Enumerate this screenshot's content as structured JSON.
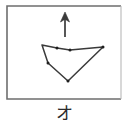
{
  "figure": {
    "caption": "オ",
    "colors": {
      "stroke": "#3a3a3a",
      "frame": "#6e6e6e",
      "frame_light": "#b8b8b8",
      "background": "#ffffff",
      "vertex_dot": "#1f1f1f"
    },
    "frame": {
      "name": "panel-border",
      "x": 7,
      "y": 6,
      "width": 114,
      "height": 93
    },
    "arrow": {
      "name": "up-arrow",
      "direction": "up",
      "x": 65,
      "tail_y": 37,
      "head_y": 12,
      "head_width": 9,
      "head_length": 10
    },
    "polygon": {
      "name": "sketch-polygon",
      "closed": true,
      "points": [
        {
          "x": 42,
          "y": 45
        },
        {
          "x": 57,
          "y": 48
        },
        {
          "x": 70,
          "y": 50
        },
        {
          "x": 103,
          "y": 47
        },
        {
          "x": 68,
          "y": 81
        },
        {
          "x": 48,
          "y": 63
        }
      ],
      "vertex_markers": [
        {
          "x": 57,
          "y": 48
        },
        {
          "x": 70,
          "y": 50
        },
        {
          "x": 103,
          "y": 47
        },
        {
          "x": 68,
          "y": 81
        },
        {
          "x": 48,
          "y": 63
        }
      ]
    }
  }
}
